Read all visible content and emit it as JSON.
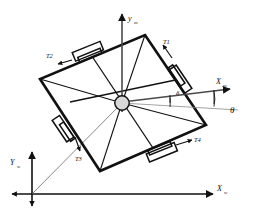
{
  "figure": {
    "type": "diagram",
    "background_color": "#ffffff",
    "stroke_color": "#111111",
    "thin_stroke_color": "#555555"
  },
  "body_frame": {
    "x_axis_label": "X",
    "x_axis_sub": "m",
    "y_axis_label": "y",
    "y_axis_sub": "m",
    "origin_marker": "center-hub-circle"
  },
  "world_frame": {
    "x_axis_label": "X",
    "x_axis_sub": "w",
    "y_axis_label": "Y",
    "y_axis_sub": "w"
  },
  "angles": {
    "delta": "δ",
    "theta": "θ"
  },
  "thrusters": [
    {
      "id": "T1",
      "label": "T1"
    },
    {
      "id": "T2",
      "label": "T2"
    },
    {
      "id": "T3",
      "label": "T3"
    },
    {
      "id": "T4",
      "label": "T4"
    }
  ],
  "geometry": {
    "body_corners": [
      {
        "name": "top",
        "x": 145,
        "y": 35
      },
      {
        "name": "right",
        "x": 206,
        "y": 125
      },
      {
        "name": "bottom",
        "x": 100,
        "y": 171
      },
      {
        "name": "left",
        "x": 40,
        "y": 79
      }
    ],
    "body_center": {
      "x": 122,
      "y": 103
    },
    "world_origin": {
      "x": 32,
      "y": 194
    }
  }
}
